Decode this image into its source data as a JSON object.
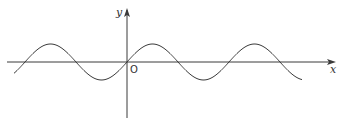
{
  "chart_data": {
    "type": "line",
    "title": "",
    "function": "y = A·sin(x)",
    "xlabel": "x",
    "ylabel": "y",
    "origin_label": "O",
    "grid": false,
    "legend": null,
    "xlim": [
      -2.53,
      4.04
    ],
    "ylim": [
      -1,
      1
    ],
    "period_px": 102,
    "amplitude_px": 18,
    "origin_px": [
      127,
      62
    ],
    "zero_crossings_px": [
      24,
      76,
      127,
      179,
      229,
      280
    ],
    "peaks_px": [
      49,
      153,
      254
    ],
    "troughs_px": [
      102,
      205
    ],
    "series": [
      {
        "name": "sine curve",
        "description": "sinusoid passing upward through origin, about 3 full periods visible"
      }
    ]
  },
  "axes": {
    "x_label": "x",
    "y_label": "y",
    "origin_label": "O"
  },
  "style": {
    "line_color": "#3a3a3a",
    "axis_color": "#3a3a3a"
  }
}
